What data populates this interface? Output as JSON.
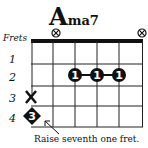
{
  "chord": {
    "root": "A",
    "quality": "ma7",
    "frets_label": "Frets",
    "fret_numbers": [
      "1",
      "2",
      "3",
      "4"
    ],
    "strings": 6,
    "muted_strings_top": [
      1,
      6
    ],
    "muted_string_side": {
      "string": 1,
      "fret": 3,
      "symbol": "X"
    },
    "fingers": [
      {
        "string": 3,
        "fret": 2,
        "finger": "1"
      },
      {
        "string": 4,
        "fret": 2,
        "finger": "1"
      },
      {
        "string": 5,
        "fret": 2,
        "finger": "1"
      }
    ],
    "optional_note": {
      "string": 1,
      "fret": 4,
      "finger": "3",
      "shape": "diamond"
    },
    "annotation": "Raise seventh one fret."
  }
}
